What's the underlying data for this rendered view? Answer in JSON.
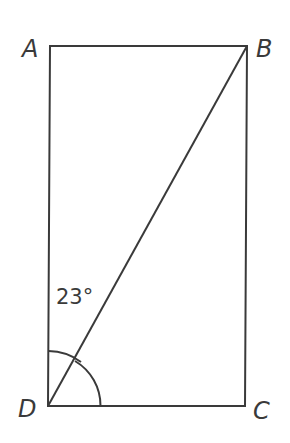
{
  "diagram": {
    "type": "rectangle-with-diagonal",
    "stroke_color": "#3a3a3a",
    "background": "#ffffff",
    "vertices": {
      "A": {
        "label": "A",
        "x": 50,
        "y": 46
      },
      "B": {
        "label": "B",
        "x": 247,
        "y": 46
      },
      "C": {
        "label": "C",
        "x": 245,
        "y": 406
      },
      "D": {
        "label": "D",
        "x": 48,
        "y": 406
      }
    },
    "diagonal": "DB",
    "angles": [
      {
        "at": "D",
        "between": [
          "DA",
          "DB"
        ],
        "label": "23°"
      },
      {
        "at": "D",
        "between": [
          "DB",
          "DC"
        ],
        "label": ""
      }
    ]
  }
}
